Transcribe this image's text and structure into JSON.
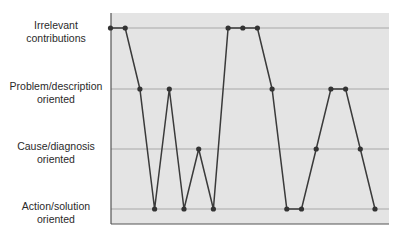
{
  "chart_data": {
    "type": "line",
    "title": "",
    "xlabel": "",
    "ylabel": "",
    "y_categories": [
      "Action/solution oriented",
      "Cause/diagnosis oriented",
      "Problem/description oriented",
      "Irrelevant contributions"
    ],
    "y_labels": [
      {
        "line1": "Irrelevant",
        "line2": "contributions"
      },
      {
        "line1": "Problem/description",
        "line2": "oriented"
      },
      {
        "line1": "Cause/diagnosis",
        "line2": "oriented"
      },
      {
        "line1": "Action/solution",
        "line2": "oriented"
      }
    ],
    "x": [
      1,
      2,
      3,
      4,
      5,
      6,
      7,
      8,
      9,
      10,
      11,
      12,
      13,
      14,
      15,
      16,
      17,
      18,
      19
    ],
    "values": [
      3,
      3,
      2,
      0,
      2,
      0,
      1,
      0,
      3,
      3,
      3,
      2,
      0,
      0,
      1,
      2,
      2,
      1,
      0
    ],
    "value_meaning": "0=Action/solution, 1=Cause/diagnosis, 2=Problem/description, 3=Irrelevant",
    "grid": true,
    "legend": null,
    "colors": {
      "plot_bg": "#e4e4e4",
      "grid": "#a8a8a8",
      "axis": "#555555",
      "line": "#3a3a3a",
      "marker": "#333333"
    }
  }
}
